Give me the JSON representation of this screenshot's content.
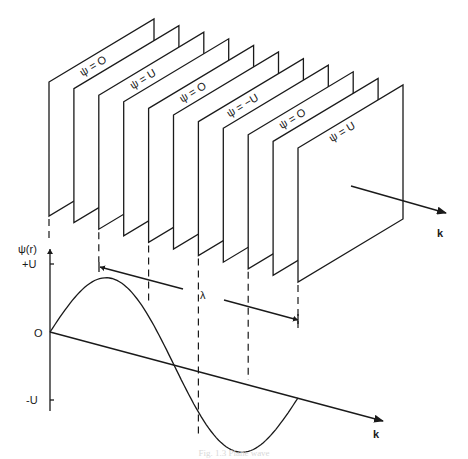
{
  "figure": {
    "caption": "Fig. 1.3  Plane wave",
    "planes": {
      "count": 11,
      "labels": [
        {
          "plane_index": 0,
          "text": "ψ = O"
        },
        {
          "plane_index": 2,
          "text": "ψ = U"
        },
        {
          "plane_index": 4,
          "text": "ψ = O"
        },
        {
          "plane_index": 6,
          "text": "ψ = −U"
        },
        {
          "plane_index": 8,
          "text": "ψ = O"
        },
        {
          "plane_index": 10,
          "text": "ψ = U"
        }
      ]
    },
    "wave_vector_label_top": "k",
    "graph": {
      "y_axis_label": "ψ(r)",
      "y_ticks": [
        "+U",
        "O",
        "-U"
      ],
      "x_axis_label": "k",
      "wavelength_label": "λ"
    }
  }
}
